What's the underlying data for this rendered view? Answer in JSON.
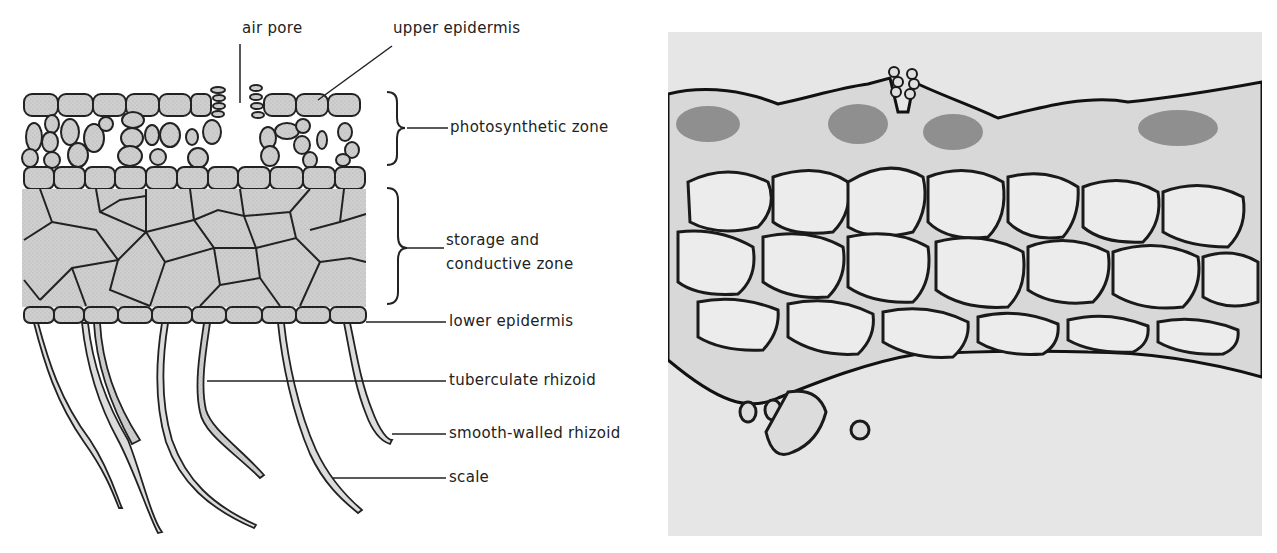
{
  "figure": {
    "diagram": {
      "subject": "thallus cross-section diagram",
      "labels": {
        "air_pore": "air pore",
        "upper_epidermis": "upper epidermis",
        "photosynthetic_zone": "photosynthetic zone",
        "storage_zone_line1": "storage and",
        "storage_zone_line2": "conductive zone",
        "lower_epidermis": "lower epidermis",
        "tuberculate_rhizoid": "tuberculate rhizoid",
        "smooth_rhizoid": "smooth-walled rhizoid",
        "scale": "scale"
      }
    },
    "micrograph": {
      "subject": "photomicrograph of thallus cross-section"
    },
    "colors": {
      "ink": "#222222",
      "tissue_fill": "#c9c9c9",
      "micro_bg": "#e6e6e6",
      "cell_wall": "#1a1a1a"
    }
  }
}
